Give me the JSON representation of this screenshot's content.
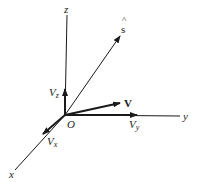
{
  "diagram": {
    "type": "3d-vector-components",
    "colors": {
      "line": "#1a1a1a",
      "text": "#222222",
      "background": "#ffffff"
    },
    "origin": {
      "label": "O",
      "x": 65,
      "y": 115
    },
    "axes": [
      {
        "id": "z",
        "label": "z",
        "end": [
          67,
          15
        ]
      },
      {
        "id": "y",
        "label": "y",
        "end": [
          180,
          116
        ]
      },
      {
        "id": "x",
        "label": "x",
        "end": [
          15,
          170
        ]
      }
    ],
    "vectors": [
      {
        "id": "s_hat",
        "label": "s",
        "accent": "^",
        "end": [
          120,
          36
        ],
        "bold": false
      },
      {
        "id": "V",
        "label": "V",
        "end": [
          120,
          103
        ],
        "bold": true
      },
      {
        "id": "Vz",
        "label": "V",
        "subscript": "z",
        "end": [
          65,
          89
        ]
      },
      {
        "id": "Vy",
        "label": "V",
        "subscript": "y",
        "end": [
          137,
          115
        ]
      },
      {
        "id": "Vx",
        "label": "V",
        "subscript": "x",
        "end": [
          43,
          134
        ]
      }
    ]
  }
}
